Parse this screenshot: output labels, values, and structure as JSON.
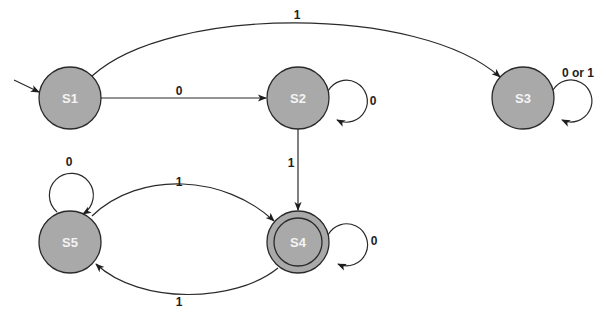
{
  "diagram": {
    "type": "finite-state-machine",
    "colors": {
      "state_fill": "#a9a9a9",
      "stroke": "#2a2a2a",
      "state_text": "#f4f4f4",
      "edge_text": "#1e1e1e"
    },
    "start_state": "S1",
    "accepting_states": [
      "S4"
    ],
    "states": [
      {
        "id": "S1",
        "label": "S1"
      },
      {
        "id": "S2",
        "label": "S2"
      },
      {
        "id": "S3",
        "label": "S3"
      },
      {
        "id": "S4",
        "label": "S4"
      },
      {
        "id": "S5",
        "label": "S5"
      }
    ],
    "transitions": [
      {
        "from": "S1",
        "to": "S2",
        "label": "0"
      },
      {
        "from": "S1",
        "to": "S3",
        "label": "1"
      },
      {
        "from": "S2",
        "to": "S2",
        "label": "0"
      },
      {
        "from": "S2",
        "to": "S4",
        "label": "1"
      },
      {
        "from": "S3",
        "to": "S3",
        "label": "0 or 1"
      },
      {
        "from": "S4",
        "to": "S4",
        "label": "0"
      },
      {
        "from": "S4",
        "to": "S5",
        "label": "1"
      },
      {
        "from": "S5",
        "to": "S4",
        "label": "1"
      },
      {
        "from": "S5",
        "to": "S5",
        "label": "0"
      }
    ]
  }
}
